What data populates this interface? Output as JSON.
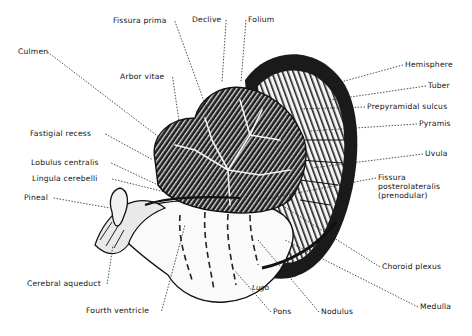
{
  "figure": {
    "signature": "Lugo",
    "colors": {
      "ink": "#111111",
      "background": "#ffffff",
      "shade": "#2a2a2a"
    }
  },
  "labels": [
    {
      "id": "fissura-prima",
      "text": "Fissura prima",
      "x": 113,
      "y": 21,
      "tx": 208,
      "ty": 112
    },
    {
      "id": "declive",
      "text": "Declive",
      "x": 192,
      "y": 20,
      "tx": 222,
      "ty": 82
    },
    {
      "id": "folium",
      "text": "Folium",
      "x": 248,
      "y": 20,
      "tx": 241,
      "ty": 82
    },
    {
      "id": "culmen",
      "text": "Culmen",
      "x": 18,
      "y": 52,
      "tx": 160,
      "ty": 138
    },
    {
      "id": "arbor-vitae",
      "text": "Arbor vitae",
      "x": 120,
      "y": 77,
      "tx": 180,
      "ty": 128
    },
    {
      "id": "hemisphere",
      "text": "Hemisphere",
      "x": 405,
      "y": 65,
      "tx": 330,
      "ty": 85
    },
    {
      "id": "tuber",
      "text": "Tuber",
      "x": 428,
      "y": 86,
      "tx": 330,
      "ty": 100
    },
    {
      "id": "prepyramidal-sulcus",
      "text": "Prepyramidal sulcus",
      "x": 367,
      "y": 107,
      "tx": 300,
      "ty": 109
    },
    {
      "id": "pyramis",
      "text": "Pyramis",
      "x": 419,
      "y": 124,
      "tx": 310,
      "ty": 131
    },
    {
      "id": "fastigial-recess",
      "text": "Fastigial recess",
      "x": 30,
      "y": 134,
      "tx": 153,
      "ty": 160
    },
    {
      "id": "uvula",
      "text": "Uvula",
      "x": 425,
      "y": 154,
      "tx": 312,
      "ty": 168
    },
    {
      "id": "lobulus-centralis",
      "text": "Lobulus centralis",
      "x": 31,
      "y": 163,
      "tx": 158,
      "ty": 185
    },
    {
      "id": "lingula-cerebelli",
      "text": "Lingula cerebelli",
      "x": 32,
      "y": 179,
      "tx": 165,
      "ty": 192
    },
    {
      "id": "fissura-posterolateralis",
      "text": "Fissura\nposterolateralis\n(prenodular)",
      "x": 378,
      "y": 178,
      "tx": 260,
      "ty": 200
    },
    {
      "id": "pineal",
      "text": "Pineal",
      "x": 24,
      "y": 198,
      "tx": 110,
      "ty": 208
    },
    {
      "id": "choroid-plexus",
      "text": "Choroid plexus",
      "x": 382,
      "y": 267,
      "tx": 285,
      "ty": 207
    },
    {
      "id": "cerebral-aqueduct",
      "text": "Cerebral aqueduct",
      "x": 27,
      "y": 284,
      "tx": 113,
      "ty": 245
    },
    {
      "id": "medulla",
      "text": "Medulla",
      "x": 420,
      "y": 307,
      "tx": 285,
      "ty": 240
    },
    {
      "id": "fourth-ventricle",
      "text": "Fourth ventricle",
      "x": 86,
      "y": 311,
      "tx": 185,
      "ty": 225
    },
    {
      "id": "pons",
      "text": "Pons",
      "x": 273,
      "y": 312,
      "tx": 235,
      "ty": 271
    },
    {
      "id": "nodulus",
      "text": "Nodulus",
      "x": 321,
      "y": 312,
      "tx": 258,
      "ty": 240
    }
  ]
}
